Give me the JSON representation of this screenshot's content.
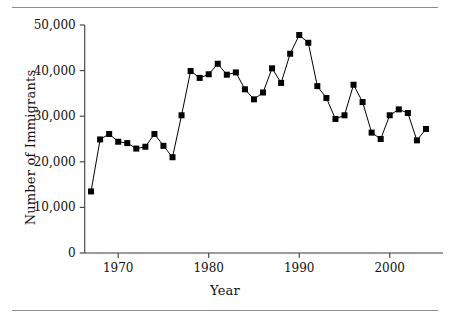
{
  "figure": {
    "has_top_rule": true,
    "has_bottom_rule": true,
    "rule_color": "#8d8d8d",
    "background": "#ffffff"
  },
  "chart_data": {
    "type": "line",
    "title": "",
    "xlabel": "Year",
    "ylabel": "Number of Immigrants",
    "xlim": [
      1966,
      2005
    ],
    "ylim": [
      0,
      50000
    ],
    "grid": false,
    "legend": null,
    "marker": "square",
    "marker_color": "#000000",
    "line_color": "#000000",
    "xticks": [
      1970,
      1980,
      1990,
      2000
    ],
    "xtick_labels": [
      "1970",
      "1980",
      "1990",
      "2000"
    ],
    "yticks": [
      0,
      10000,
      20000,
      30000,
      40000,
      50000
    ],
    "ytick_labels": [
      "0",
      "10,000",
      "20,000",
      "30,000",
      "40,000",
      "50,000"
    ],
    "x": [
      1967,
      1968,
      1969,
      1970,
      1971,
      1972,
      1973,
      1974,
      1975,
      1976,
      1977,
      1978,
      1979,
      1980,
      1981,
      1982,
      1983,
      1984,
      1985,
      1986,
      1987,
      1988,
      1989,
      1990,
      1991,
      1992,
      1993,
      1994,
      1995,
      1996,
      1997,
      1998,
      1999,
      2000,
      2001,
      2002,
      2003,
      2004
    ],
    "values": [
      13500,
      24900,
      26100,
      24400,
      24100,
      22900,
      23300,
      26100,
      23500,
      21000,
      30200,
      39900,
      38400,
      39200,
      41500,
      39100,
      39600,
      35900,
      33700,
      35200,
      40500,
      37300,
      43700,
      47800,
      46100,
      36600,
      34000,
      29400,
      30200,
      36900,
      33100,
      26400,
      25000,
      30200,
      31500,
      30700,
      24700,
      27200
    ]
  }
}
